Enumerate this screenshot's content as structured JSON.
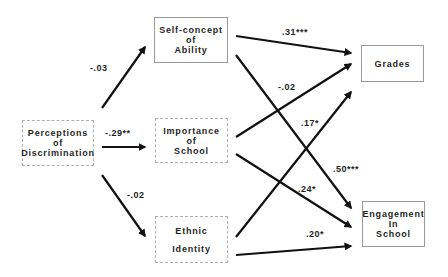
{
  "diagram": {
    "type": "path-model",
    "nodes": {
      "perceptions": {
        "lines": [
          "Perceptions",
          "of",
          "Discrimination"
        ]
      },
      "self_concept": {
        "lines": [
          "Self-concept",
          "of",
          "Ability"
        ]
      },
      "importance": {
        "lines": [
          "Importance",
          "of",
          "School"
        ]
      },
      "ethnic": {
        "lines": [
          "Ethnic",
          "Identity"
        ]
      },
      "grades": {
        "lines": [
          "Grades"
        ]
      },
      "engagement": {
        "lines": [
          "Engagement",
          "In",
          "School"
        ]
      }
    },
    "paths": [
      {
        "from": "Perceptions of Discrimination",
        "to": "Self-concept of Ability",
        "coef": "-.03"
      },
      {
        "from": "Perceptions of Discrimination",
        "to": "Importance of School",
        "coef": "-.29**"
      },
      {
        "from": "Perceptions of Discrimination",
        "to": "Ethnic Identity",
        "coef": "-.02"
      },
      {
        "from": "Self-concept of Ability",
        "to": "Grades",
        "coef": ".31***"
      },
      {
        "from": "Self-concept of Ability",
        "to": "Engagement In School",
        "coef": ".50***"
      },
      {
        "from": "Importance of School",
        "to": "Grades",
        "coef": "-.02"
      },
      {
        "from": "Importance of School",
        "to": "Engagement In School",
        "coef": ".24*"
      },
      {
        "from": "Ethnic Identity",
        "to": "Grades",
        "coef": ".17*"
      },
      {
        "from": "Ethnic Identity",
        "to": "Engagement In School",
        "coef": ".20*"
      }
    ],
    "colors": {
      "arrow": "#111111",
      "border": "#9a9a9a",
      "text": "#1f1f1f"
    }
  }
}
